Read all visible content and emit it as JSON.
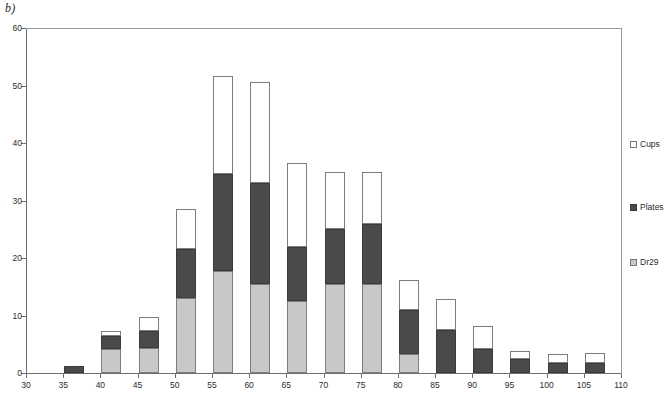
{
  "panel": {
    "label": "b)"
  },
  "legend": {
    "position": "right",
    "entries": [
      {
        "name": "Cups",
        "swatch": "white-square-icon",
        "color": "#ffffff"
      },
      {
        "name": "Plates",
        "swatch": "dark-gray-square-icon",
        "color": "#4a4a4a"
      },
      {
        "name": "Dr29",
        "swatch": "light-gray-square-icon",
        "color": "#c8c8c8"
      }
    ]
  },
  "axes": {
    "y_ticks": [
      "0",
      "10",
      "20",
      "30",
      "40",
      "50",
      "60"
    ],
    "x_ticks": [
      "30",
      "35",
      "40",
      "45",
      "50",
      "55",
      "60",
      "65",
      "70",
      "75",
      "80",
      "85",
      "90",
      "95",
      "100",
      "105",
      "110"
    ]
  },
  "chart_data": {
    "type": "bar",
    "stacked": true,
    "title": "b)",
    "xlabel": "",
    "ylabel": "",
    "xlim": [
      30,
      110
    ],
    "ylim": [
      0,
      60
    ],
    "ytick_step": 10,
    "xtick_step": 5,
    "grid": false,
    "legend_position": "right",
    "categories": [
      "30",
      "35",
      "40",
      "45",
      "50",
      "55",
      "60",
      "65",
      "70",
      "75",
      "80",
      "85",
      "90",
      "95",
      "100",
      "105",
      "110"
    ],
    "series": [
      {
        "name": "Dr29",
        "color": "#c8c8c8",
        "values": [
          0,
          0,
          4.2,
          4.3,
          13.0,
          17.8,
          15.5,
          12.5,
          15.5,
          15.5,
          3.3,
          0,
          0,
          0,
          0,
          0,
          0
        ]
      },
      {
        "name": "Plates",
        "color": "#4a4a4a",
        "values": [
          0,
          1.3,
          2.3,
          3.0,
          8.5,
          16.8,
          17.5,
          9.5,
          9.5,
          10.5,
          7.7,
          7.4,
          4.1,
          2.4,
          1.8,
          1.8,
          0
        ]
      },
      {
        "name": "Cups",
        "color": "#ffffff",
        "values": [
          0,
          0,
          0.8,
          2.5,
          7.0,
          17.0,
          17.6,
          14.6,
          10.0,
          9.0,
          5.2,
          5.4,
          4.1,
          1.4,
          1.5,
          1.6,
          0
        ]
      }
    ],
    "totals": [
      0,
      1.3,
      7.3,
      9.8,
      28.5,
      51.6,
      50.6,
      36.6,
      35.0,
      35.0,
      16.2,
      12.8,
      8.2,
      3.8,
      3.3,
      3.4,
      0
    ]
  }
}
